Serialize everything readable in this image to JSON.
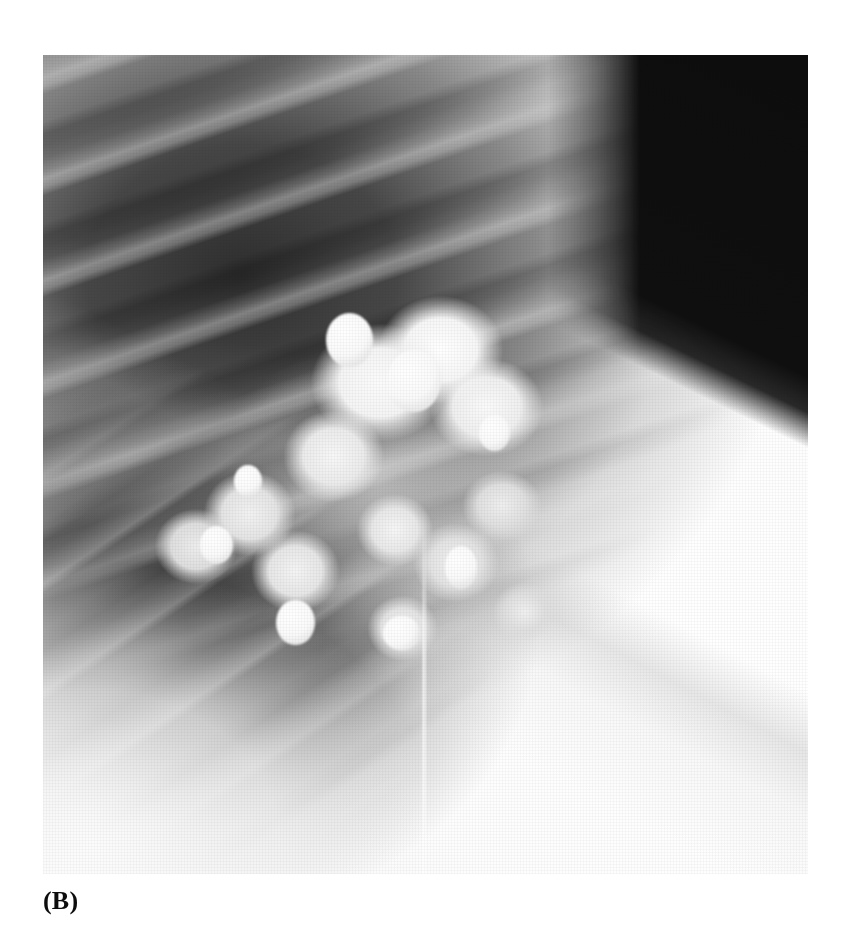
{
  "figure": {
    "caption": "(B)",
    "modality_label": "chest-radiograph",
    "panel_letter": "B"
  },
  "page": {
    "background_color": "#ffffff",
    "width": 851,
    "height": 937
  },
  "image": {
    "name": "chest-radiograph-coned-view",
    "x": 43,
    "y": 55,
    "width": 765,
    "height": 819,
    "colors": {
      "film_white": "#ffffff",
      "soft_tissue": "#f4f4f4",
      "lung_field_dark": "#2a2a2a",
      "collimation_black": "#0a0a0a",
      "calcification_white": "#fdfdfd"
    },
    "regions": [
      {
        "name": "lung-field-dark-zone",
        "description": "dark aerated lung occupying upper-left and mid-left of the film"
      },
      {
        "name": "rib-shadow-band",
        "description": "series of obliquely oriented posterior rib shadows crossing the lung field"
      },
      {
        "name": "calcified-mass",
        "description": "large lobulated popcorn-pattern calcified pulmonary mass near image center"
      },
      {
        "name": "calcific-nodule-cluster",
        "description": "cluster of discrete punctate and coarse calcific nodules within the mass"
      },
      {
        "name": "chest-wall-soft-tissue",
        "description": "bright homogeneous soft tissue filling the right portion of the film"
      },
      {
        "name": "diaphragm-border",
        "description": "curved bright interface along the lower-left margin"
      },
      {
        "name": "collimation-corner",
        "description": "black triangular unexposed corner at the upper right"
      },
      {
        "name": "film-artifact-line",
        "description": "faint vertical bright streak in the lower right quadrant"
      }
    ]
  }
}
